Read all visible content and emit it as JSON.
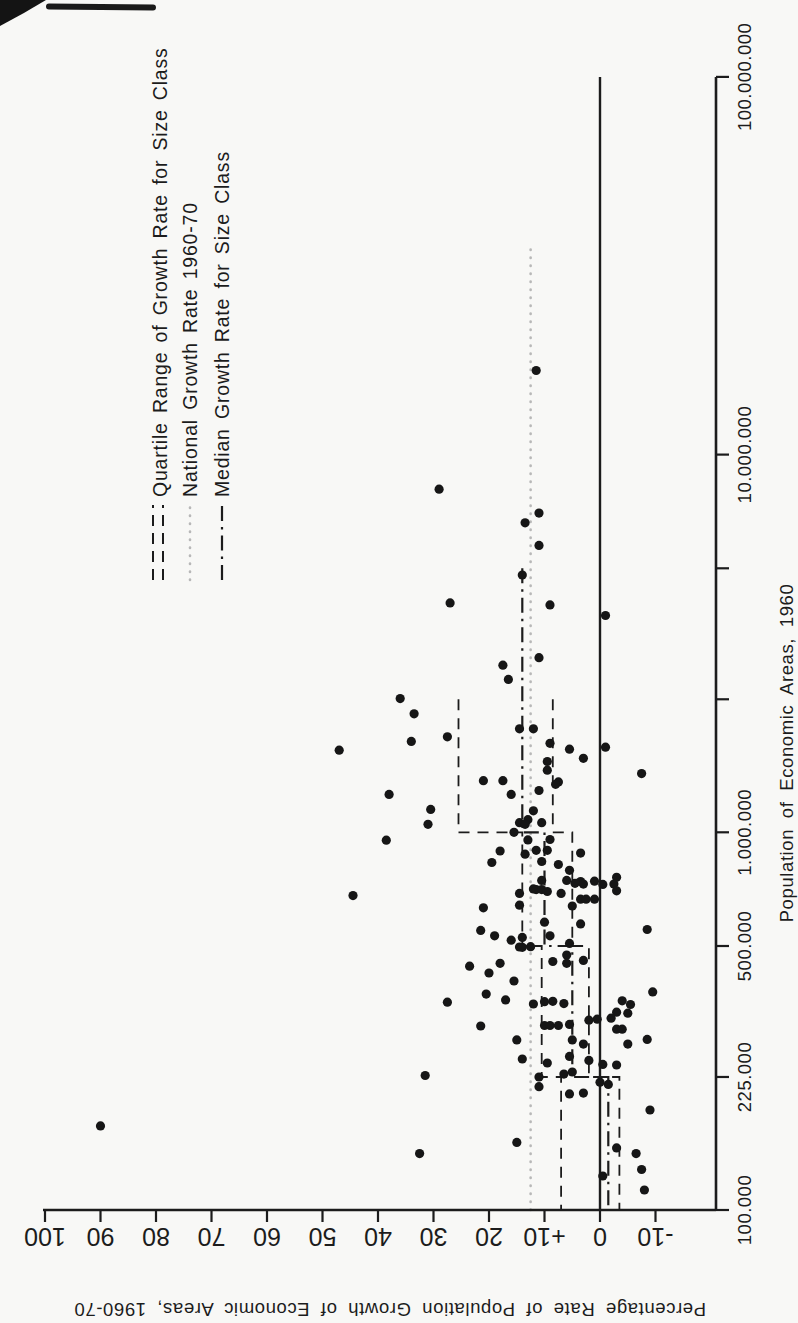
{
  "page": {
    "background": "#f8f8f6",
    "ink": "#1c1c1c",
    "muted_dotted": "#b8b8b8"
  },
  "chart_data": {
    "type": "scatter",
    "title": "",
    "xlabel": "Population of Economic Areas, 1960",
    "ylabel": "Percentage Rate of Population Growth of Economic Areas, 1960-70",
    "x_scale": "log",
    "x_range": [
      100000,
      100000000
    ],
    "y_range": [
      -20,
      100
    ],
    "grid": false,
    "legend_position": "top-right",
    "x_ticks": [
      {
        "value": 100000,
        "label": "100.000"
      },
      {
        "value": 225000,
        "label": "225.000"
      },
      {
        "value": 500000,
        "label": "500.000"
      },
      {
        "value": 1000000,
        "label": "1.000.000"
      },
      {
        "value": 2250000,
        "label": ""
      },
      {
        "value": 5000000,
        "label": ""
      },
      {
        "value": 10000000,
        "label": "10.000.000"
      },
      {
        "value": 100000000,
        "label": "100.000.000"
      }
    ],
    "y_ticks": [
      {
        "value": 100,
        "label": "100"
      },
      {
        "value": 90,
        "label": "90"
      },
      {
        "value": 80,
        "label": "80"
      },
      {
        "value": 70,
        "label": "70"
      },
      {
        "value": 60,
        "label": "60"
      },
      {
        "value": 50,
        "label": "50"
      },
      {
        "value": 40,
        "label": "40"
      },
      {
        "value": 30,
        "label": "30"
      },
      {
        "value": 20,
        "label": "20"
      },
      {
        "value": 10,
        "label": "+10"
      },
      {
        "value": 0,
        "label": "0"
      },
      {
        "value": -10,
        "label": "-10"
      }
    ],
    "zero_line": 0,
    "national_growth_rate": {
      "value": 12.5,
      "extent_max_pop": 35000000
    },
    "size_classes": [
      {
        "pop_min": 100000,
        "pop_max": 225000,
        "q1": -3.5,
        "median": -1.5,
        "q3": 7
      },
      {
        "pop_min": 225000,
        "pop_max": 500000,
        "q1": 2,
        "median": 5,
        "q3": 10.5
      },
      {
        "pop_min": 500000,
        "pop_max": 1000000,
        "q1": 5,
        "median": 10,
        "q3": 14
      },
      {
        "pop_min": 1000000,
        "pop_max": 2250000,
        "q1": 8.5,
        "median": 14,
        "q3": 25.5
      },
      {
        "pop_min": 2250000,
        "pop_max": 5000000,
        "median": 14
      }
    ],
    "legend": [
      {
        "label": "Quartile Range of Growth Rate for Size Class",
        "style": "double-dashed"
      },
      {
        "label": "National Growth Rate 1960-70",
        "style": "dotted"
      },
      {
        "label": "Median Growth Rate for Size Class",
        "style": "dash-dot"
      }
    ],
    "points": [
      [
        16700000,
        11.5
      ],
      [
        8100000,
        29
      ],
      [
        7000000,
        11
      ],
      [
        6600000,
        13.5
      ],
      [
        5750000,
        11
      ],
      [
        4800000,
        14
      ],
      [
        4050000,
        27
      ],
      [
        4000000,
        9
      ],
      [
        3750000,
        -1
      ],
      [
        2900000,
        11
      ],
      [
        2770000,
        17.5
      ],
      [
        2540000,
        16.5
      ],
      [
        2260000,
        36
      ],
      [
        2060000,
        33.5
      ],
      [
        1880000,
        14.5
      ],
      [
        1880000,
        12
      ],
      [
        1790000,
        27.5
      ],
      [
        1740000,
        34
      ],
      [
        1720000,
        9
      ],
      [
        1680000,
        -1
      ],
      [
        1660000,
        5.5
      ],
      [
        1650000,
        47
      ],
      [
        1570000,
        3
      ],
      [
        1540000,
        9.5
      ],
      [
        1460000,
        9.5
      ],
      [
        1430000,
        -7.5
      ],
      [
        1370000,
        21
      ],
      [
        1370000,
        17.5
      ],
      [
        1360000,
        7.5
      ],
      [
        1340000,
        8
      ],
      [
        1290000,
        11
      ],
      [
        1260000,
        16
      ],
      [
        1260000,
        38
      ],
      [
        1150000,
        30.5
      ],
      [
        1140000,
        12
      ],
      [
        1080000,
        13
      ],
      [
        1060000,
        14.5
      ],
      [
        1060000,
        10.5
      ],
      [
        1050000,
        13.5
      ],
      [
        1050000,
        31
      ],
      [
        1000000,
        15.5
      ],
      [
        957000,
        9
      ],
      [
        955000,
        13
      ],
      [
        953000,
        38.5
      ],
      [
        896000,
        11.5
      ],
      [
        896000,
        9.5
      ],
      [
        892000,
        18
      ],
      [
        881000,
        3.5
      ],
      [
        875000,
        13.5
      ],
      [
        837000,
        10.5
      ],
      [
        832000,
        19.5
      ],
      [
        822000,
        7.5
      ],
      [
        793000,
        5.5
      ],
      [
        760000,
        -3
      ],
      [
        746000,
        10.5
      ],
      [
        746000,
        6
      ],
      [
        742000,
        1
      ],
      [
        741000,
        3.5
      ],
      [
        733000,
        4.5
      ],
      [
        729000,
        3
      ],
      [
        729000,
        -2.5
      ],
      [
        728000,
        -0.5
      ],
      [
        708000,
        12
      ],
      [
        705000,
        11.5
      ],
      [
        705000,
        10.5
      ],
      [
        700000,
        -3
      ],
      [
        697000,
        9.5
      ],
      [
        689000,
        7
      ],
      [
        689000,
        14.5
      ],
      [
        680000,
        44.5
      ],
      [
        665000,
        3.5
      ],
      [
        665000,
        2.5
      ],
      [
        665000,
        1
      ],
      [
        641000,
        14.5
      ],
      [
        638000,
        5
      ],
      [
        631000,
        21
      ],
      [
        578000,
        10
      ],
      [
        572000,
        3.5
      ],
      [
        553000,
        -8.5
      ],
      [
        550000,
        21.5
      ],
      [
        532000,
        19
      ],
      [
        532000,
        9
      ],
      [
        527000,
        14
      ],
      [
        518000,
        16
      ],
      [
        508000,
        5.5
      ],
      [
        498000,
        12.5
      ],
      [
        497000,
        14.5
      ],
      [
        496000,
        14
      ],
      [
        473000,
        6
      ],
      [
        458000,
        3
      ],
      [
        455000,
        8.5
      ],
      [
        450000,
        18
      ],
      [
        450000,
        6
      ],
      [
        442000,
        23.5
      ],
      [
        424000,
        20
      ],
      [
        404000,
        15.5
      ],
      [
        378000,
        -9.5
      ],
      [
        373000,
        20.5
      ],
      [
        360000,
        17
      ],
      [
        358000,
        -4
      ],
      [
        357000,
        8.5
      ],
      [
        356000,
        10
      ],
      [
        355000,
        27.5
      ],
      [
        352000,
        6.5
      ],
      [
        351000,
        12
      ],
      [
        350000,
        -5.5
      ],
      [
        334000,
        -3
      ],
      [
        332000,
        -5
      ],
      [
        322000,
        -2
      ],
      [
        320000,
        0.5
      ],
      [
        318000,
        2
      ],
      [
        310000,
        5.5
      ],
      [
        308000,
        10
      ],
      [
        308000,
        9
      ],
      [
        308000,
        7.5
      ],
      [
        307000,
        21.5
      ],
      [
        301000,
        -3
      ],
      [
        301000,
        -4
      ],
      [
        283000,
        -8.5
      ],
      [
        282000,
        15
      ],
      [
        282000,
        5
      ],
      [
        275000,
        3
      ],
      [
        275000,
        -5
      ],
      [
        255000,
        5.5
      ],
      [
        251000,
        14
      ],
      [
        249000,
        2
      ],
      [
        245000,
        9.5
      ],
      [
        243000,
        -0.5
      ],
      [
        242000,
        -3
      ],
      [
        232000,
        5
      ],
      [
        229000,
        6.5
      ],
      [
        227000,
        31.5
      ],
      [
        225000,
        11
      ],
      [
        218000,
        0
      ],
      [
        215000,
        -1.5
      ],
      [
        212000,
        11
      ],
      [
        204000,
        3
      ],
      [
        203000,
        5.5
      ],
      [
        184000,
        -9
      ],
      [
        167000,
        90
      ],
      [
        151000,
        15
      ],
      [
        146000,
        -3
      ],
      [
        141000,
        32.5
      ],
      [
        141000,
        -6.5
      ],
      [
        128000,
        -7.5
      ],
      [
        123000,
        -0.5
      ],
      [
        113000,
        -8
      ]
    ]
  }
}
